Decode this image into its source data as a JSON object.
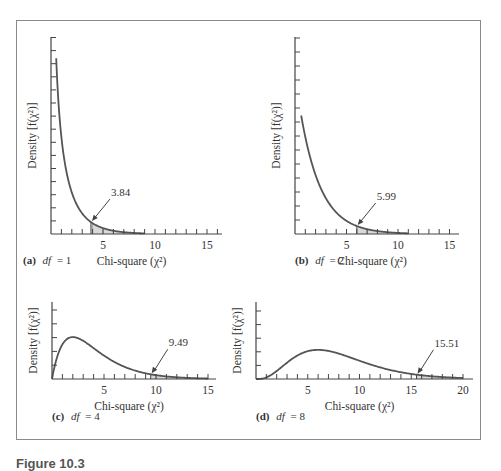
{
  "figure": {
    "caption": "Figure 10.3",
    "frame_color": "#8a8a8a",
    "curve_color": "#555555",
    "shade_color": "#d9d9d9"
  },
  "chart_data": [
    {
      "type": "line",
      "panel": "(a)",
      "title": "df = 1",
      "title_prefix": "(a)",
      "df_label": "df",
      "df_value": "= 1",
      "df": 1,
      "xlabel": "Chi-square (χ²)",
      "ylabel": "Density [f(χ²)]",
      "xticks": [
        5,
        10,
        15
      ],
      "xlim": [
        0,
        16.5
      ],
      "critical_value": 3.84,
      "critical_label": "3.84",
      "shaded_region": [
        3.84,
        9
      ],
      "curve_range": [
        0.5,
        9
      ],
      "y_ticks_count": 15,
      "grid": false
    },
    {
      "type": "line",
      "panel": "(b)",
      "title": "df = 2",
      "title_prefix": "(b)",
      "df_label": "df",
      "df_value": "= 2",
      "df": 2,
      "xlabel": "Chi-square (χ²)",
      "ylabel": "Density [f(χ²)]",
      "xticks": [
        5,
        10,
        15
      ],
      "xlim": [
        0,
        16
      ],
      "critical_value": 5.99,
      "critical_label": "5.99",
      "shaded_region": [
        5.99,
        11
      ],
      "curve_range": [
        0.6,
        11
      ],
      "y_ticks_count": 14,
      "grid": false
    },
    {
      "type": "line",
      "panel": "(c)",
      "title": "df = 4",
      "title_prefix": "(c)",
      "df_label": "df",
      "df_value": "= 4",
      "df": 4,
      "xlabel": "Chi-square (χ²)",
      "ylabel": "Density [f(χ²)]",
      "xticks": [
        5,
        10,
        15
      ],
      "xlim": [
        0,
        16.5
      ],
      "critical_value": 9.49,
      "critical_label": "9.49",
      "shaded_region": [
        9.49,
        15
      ],
      "curve_range": [
        0,
        15
      ],
      "y_ticks_count": 5,
      "grid": false
    },
    {
      "type": "line",
      "panel": "(d)",
      "title": "df = 8",
      "title_prefix": "(d)",
      "df_label": "df",
      "df_value": "= 8",
      "df": 8,
      "xlabel": "Chi-square (χ²)",
      "ylabel": "Density [f(χ²)]",
      "xticks": [
        5,
        10,
        15,
        20
      ],
      "xlim": [
        0,
        21
      ],
      "critical_value": 15.51,
      "critical_label": "15.51",
      "shaded_region": [
        15.51,
        20
      ],
      "curve_range": [
        0,
        20
      ],
      "y_ticks_count": 5,
      "grid": false
    }
  ]
}
